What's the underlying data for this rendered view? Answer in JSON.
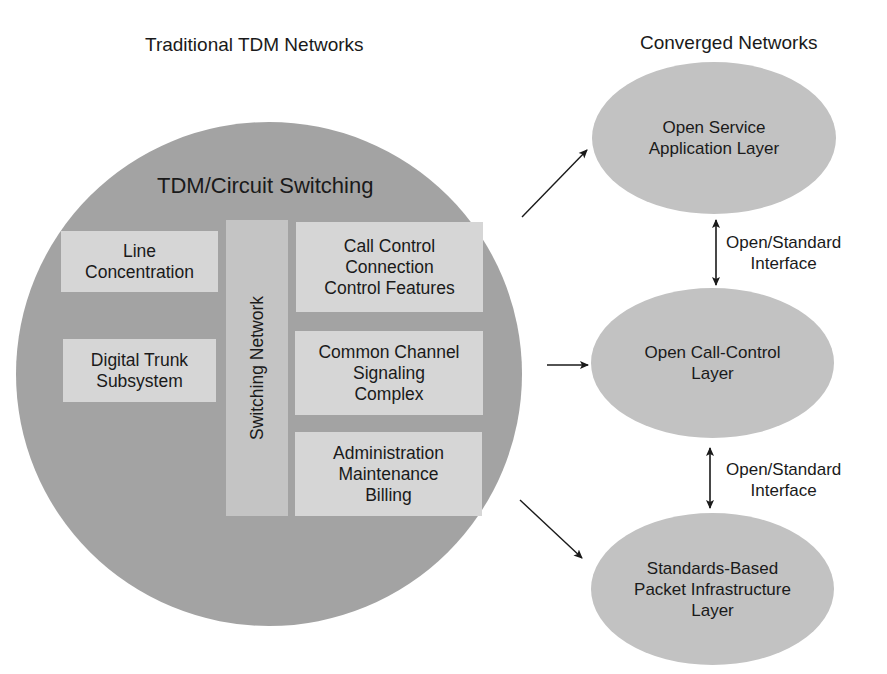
{
  "headings": {
    "left": "Traditional TDM Networks",
    "right": "Converged Networks"
  },
  "tdm_circle": {
    "title": "TDM/Circuit Switching",
    "left_boxes": [
      {
        "lines": [
          "Line",
          "Concentration"
        ]
      },
      {
        "lines": [
          "Digital Trunk",
          "Subsystem"
        ]
      }
    ],
    "center_column": "Switching Network",
    "right_boxes": [
      {
        "lines": [
          "Call Control",
          "Connection",
          "Control Features"
        ]
      },
      {
        "lines": [
          "Common Channel",
          "Signaling",
          "Complex"
        ]
      },
      {
        "lines": [
          "Administration",
          "Maintenance",
          "Billing"
        ]
      }
    ]
  },
  "converged_layers": [
    {
      "lines": [
        "Open Service",
        "Application Layer"
      ]
    },
    {
      "lines": [
        "Open Call-Control",
        "Layer"
      ]
    },
    {
      "lines": [
        "Standards-Based",
        "Packet Infrastructure",
        "Layer"
      ]
    }
  ],
  "interfaces": [
    {
      "lines": [
        "Open/Standard",
        "Interface"
      ]
    },
    {
      "lines": [
        "Open/Standard",
        "Interface"
      ]
    }
  ],
  "colors": {
    "circle_fill": "#a3a3a3",
    "box_fill": "#d6d6d6",
    "column_fill": "#c4c4c4",
    "ellipse_fill": "#c2c2c2",
    "arrow": "#1a1a1a"
  }
}
